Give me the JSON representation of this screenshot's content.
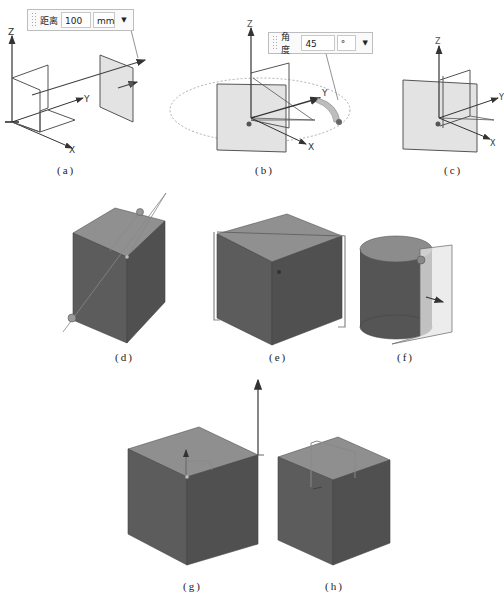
{
  "figure": {
    "panels": [
      {
        "id": "a",
        "caption": "(a)",
        "axes": [
          "Z",
          "Y",
          "X"
        ],
        "dimension_box": {
          "label": "距离",
          "value": "100",
          "unit": "mm"
        }
      },
      {
        "id": "b",
        "caption": "(b)",
        "axes": [
          "Z",
          "Y",
          "X"
        ],
        "dimension_box": {
          "label": "角度",
          "value": "45",
          "unit": "°"
        }
      },
      {
        "id": "c",
        "caption": "(c)",
        "axes": [
          "Z",
          "Y",
          "X"
        ]
      },
      {
        "id": "d",
        "caption": "(d)"
      },
      {
        "id": "e",
        "caption": "(e)"
      },
      {
        "id": "f",
        "caption": "(f)"
      },
      {
        "id": "g",
        "caption": "(g)"
      },
      {
        "id": "h",
        "caption": "(h)"
      }
    ]
  },
  "colors": {
    "cube_front": "#5a5a5a",
    "cube_side": "#4e4e4e",
    "cube_top": "#8f8f8f",
    "plane_fill": "#e6e6e6",
    "line": "#444444"
  }
}
